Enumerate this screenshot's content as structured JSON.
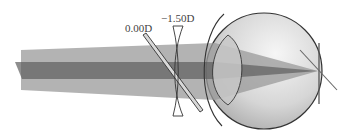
{
  "diagram": {
    "title": "",
    "labels": {
      "plano_lens": "0.00D",
      "concave_lens": "−1.50D"
    },
    "elements": [
      {
        "id": "outer-beam",
        "description": "wide parallel light beam"
      },
      {
        "id": "inner-beam",
        "description": "narrow central ray bundle"
      },
      {
        "id": "plano-lens",
        "description": "tilted plano lens 0.00D"
      },
      {
        "id": "concave-lens",
        "description": "concave corrective lens -1.50D"
      },
      {
        "id": "eye",
        "description": "eyeball cross-section with crystalline lens"
      },
      {
        "id": "retina",
        "description": "retina plane / focal point"
      }
    ],
    "colors": {
      "outer_beam": "#9a9a9a",
      "inner_beam": "#6a6a6a",
      "eye_fill": "#e2e2e2",
      "eye_stroke": "#333333",
      "lens_stroke": "#333333",
      "crystalline_lens": "#c8c8c8"
    }
  }
}
